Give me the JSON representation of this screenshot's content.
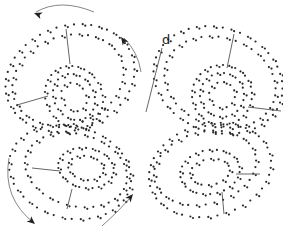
{
  "diagram": {
    "width": 283,
    "height": 233,
    "colors": {
      "dot": "#2a2a2a",
      "line": "#555555",
      "arrow": "#777777",
      "arrowhead": "#222222"
    },
    "label": {
      "text": "d",
      "x": 162,
      "y": 44
    },
    "wings": [
      {
        "name": "upper-left-wing",
        "rings": [
          {
            "cx": 70,
            "cy": 78,
            "rx": 66,
            "ry": 52,
            "rot": -20,
            "n": 46
          },
          {
            "cx": 68,
            "cy": 80,
            "rx": 57,
            "ry": 44,
            "rot": -20,
            "n": 40
          }
        ],
        "spots": [
          {
            "cx": 74,
            "cy": 97,
            "rx": 28,
            "ry": 32,
            "rot": -30,
            "n": 30
          },
          {
            "cx": 74,
            "cy": 97,
            "rx": 20,
            "ry": 24,
            "rot": -30,
            "n": 22
          },
          {
            "cx": 74,
            "cy": 97,
            "rx": 12,
            "ry": 15,
            "rot": -30,
            "n": 12
          }
        ]
      },
      {
        "name": "upper-right-wing",
        "rings": [
          {
            "cx": 218,
            "cy": 80,
            "rx": 66,
            "ry": 52,
            "rot": 20,
            "n": 46
          },
          {
            "cx": 220,
            "cy": 82,
            "rx": 57,
            "ry": 44,
            "rot": 20,
            "n": 40
          }
        ],
        "spots": [
          {
            "cx": 222,
            "cy": 95,
            "rx": 30,
            "ry": 30,
            "rot": 20,
            "n": 30
          },
          {
            "cx": 222,
            "cy": 95,
            "rx": 22,
            "ry": 22,
            "rot": 20,
            "n": 22
          },
          {
            "cx": 222,
            "cy": 95,
            "rx": 13,
            "ry": 13,
            "rot": 20,
            "n": 12
          }
        ]
      },
      {
        "name": "lower-left-wing",
        "rings": [
          {
            "cx": 70,
            "cy": 172,
            "rx": 62,
            "ry": 46,
            "rot": 15,
            "n": 42
          },
          {
            "cx": 76,
            "cy": 170,
            "rx": 52,
            "ry": 36,
            "rot": 15,
            "n": 36
          }
        ],
        "spots": [
          {
            "cx": 86,
            "cy": 168,
            "rx": 28,
            "ry": 20,
            "rot": 10,
            "n": 26
          },
          {
            "cx": 86,
            "cy": 168,
            "rx": 18,
            "ry": 12,
            "rot": 10,
            "n": 16
          }
        ]
      },
      {
        "name": "lower-right-wing",
        "rings": [
          {
            "cx": 210,
            "cy": 170,
            "rx": 62,
            "ry": 46,
            "rot": -15,
            "n": 42
          },
          {
            "cx": 205,
            "cy": 168,
            "rx": 52,
            "ry": 36,
            "rot": -15,
            "n": 36
          }
        ],
        "spots": [
          {
            "cx": 210,
            "cy": 172,
            "rx": 30,
            "ry": 22,
            "rot": -10,
            "n": 26
          },
          {
            "cx": 210,
            "cy": 172,
            "rx": 20,
            "ry": 13,
            "rot": -10,
            "n": 16
          }
        ]
      }
    ],
    "leader_lines": [
      {
        "name": "label-d-line",
        "x1": 162,
        "y1": 48,
        "x2": 146,
        "y2": 112
      },
      {
        "name": "upper-left-top-line",
        "x1": 66,
        "y1": 29,
        "x2": 70,
        "y2": 64
      },
      {
        "name": "upper-left-side-line",
        "x1": 17,
        "y1": 105,
        "x2": 48,
        "y2": 96
      },
      {
        "name": "upper-right-top-line",
        "x1": 234,
        "y1": 34,
        "x2": 227,
        "y2": 68
      },
      {
        "name": "upper-right-side-line",
        "x1": 248,
        "y1": 107,
        "x2": 281,
        "y2": 111
      },
      {
        "name": "lower-left-side-line",
        "x1": 32,
        "y1": 168,
        "x2": 60,
        "y2": 171
      },
      {
        "name": "lower-left-bottom-line",
        "x1": 72,
        "y1": 189,
        "x2": 67,
        "y2": 209
      },
      {
        "name": "lower-right-side-line",
        "x1": 236,
        "y1": 174,
        "x2": 260,
        "y2": 174
      },
      {
        "name": "lower-right-bottom-line",
        "x1": 222,
        "y1": 192,
        "x2": 224,
        "y2": 214
      }
    ],
    "arrows": [
      {
        "name": "top-left-arrow",
        "path": "M 94 12 Q 60 -2 36 12",
        "head": {
          "x": 34,
          "y": 13,
          "angle": 200
        }
      },
      {
        "name": "middle-top-arrow",
        "path": "M 141 72 Q 138 52 124 38",
        "head": {
          "x": 121,
          "y": 37,
          "angle": 235
        }
      },
      {
        "name": "lower-left-arrow",
        "path": "M 9 158 Q 2 198 34 223",
        "head": {
          "x": 35,
          "y": 224,
          "angle": 40
        }
      },
      {
        "name": "lower-middle-arrow",
        "path": "M 102 226 Q 116 214 132 196",
        "head": {
          "x": 133,
          "y": 194,
          "angle": 310
        }
      }
    ]
  }
}
